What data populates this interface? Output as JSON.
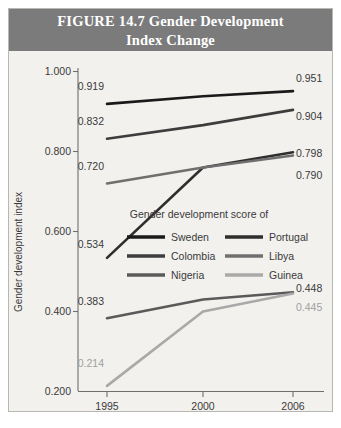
{
  "figure": {
    "title_line1": "FIGURE 14.7    Gender Development",
    "title_line2": "Index Change",
    "title_bar_color": "#7b7b7b",
    "background_color": "#f2f1ee"
  },
  "chart_data": {
    "type": "line",
    "title": "FIGURE 14.7 Gender Development Index Change",
    "xlabel": "",
    "ylabel": "Gender development index",
    "categories": [
      "1995",
      "2000",
      "2006"
    ],
    "x": [
      1995,
      2000,
      2006
    ],
    "ylim": [
      0.2,
      1.0
    ],
    "yticks": [
      "0.200",
      "0.400",
      "0.600",
      "0.800",
      "1.000"
    ],
    "ytick_values": [
      0.2,
      0.4,
      0.6,
      0.8,
      1.0
    ],
    "grid": false,
    "legend_position": "center",
    "legend_title": "Gender development score of",
    "series": [
      {
        "name": "Sweden",
        "color": "#1a1a1a",
        "values": [
          0.919,
          0.938,
          0.951
        ],
        "start_label": "0.919",
        "end_label": "0.951"
      },
      {
        "name": "Portugal",
        "color": "#2e2e2e",
        "values": [
          0.534,
          0.76,
          0.798
        ],
        "start_label": "0.534",
        "end_label": "0.798"
      },
      {
        "name": "Colombia",
        "color": "#3d3d3d",
        "values": [
          0.832,
          0.866,
          0.904
        ],
        "start_label": "0.832",
        "end_label": "0.904"
      },
      {
        "name": "Libya",
        "color": "#6f6f6f",
        "values": [
          0.72,
          0.76,
          0.79
        ],
        "start_label": "0.720",
        "end_label": "0.790"
      },
      {
        "name": "Nigeria",
        "color": "#5a5a5a",
        "values": [
          0.383,
          0.43,
          0.448
        ],
        "start_label": "0.383",
        "end_label": "0.448"
      },
      {
        "name": "Guinea",
        "color": "#a9a9a9",
        "values": [
          0.214,
          0.4,
          0.445
        ],
        "start_label": "0.214",
        "end_label": "0.445"
      }
    ]
  },
  "legend": {
    "title": "Gender development score of",
    "items": [
      {
        "label": "Sweden",
        "color": "#1a1a1a"
      },
      {
        "label": "Portugal",
        "color": "#2e2e2e"
      },
      {
        "label": "Colombia",
        "color": "#3d3d3d"
      },
      {
        "label": "Libya",
        "color": "#6f6f6f"
      },
      {
        "label": "Nigeria",
        "color": "#5a5a5a"
      },
      {
        "label": "Guinea",
        "color": "#a9a9a9"
      }
    ]
  },
  "axes": {
    "y_title": "Gender development index",
    "y_ticks": [
      "1.000",
      "0.800",
      "0.600",
      "0.400",
      "0.200"
    ],
    "x_ticks": [
      "1995",
      "2000",
      "2006"
    ]
  },
  "labels": {
    "sweden_start": "0.919",
    "sweden_end": "0.951",
    "colombia_start": "0.832",
    "colombia_end": "0.904",
    "libya_start": "0.720",
    "libya_end": "0.790",
    "portugal_start": "0.534",
    "portugal_end": "0.798",
    "nigeria_start": "0.383",
    "nigeria_end": "0.448",
    "guinea_start": "0.214",
    "guinea_end": "0.445"
  }
}
